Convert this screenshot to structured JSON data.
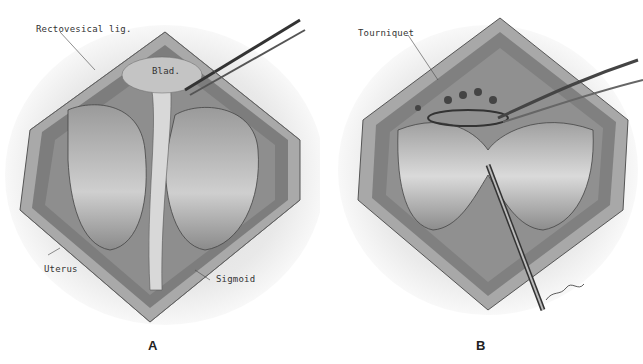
{
  "figure": {
    "panels": [
      {
        "id": "A",
        "caption": "A",
        "labels": {
          "rectovesical": "Rectovesical lig.",
          "bladder": "Blad.",
          "uterus": "Uterus",
          "sigmoid": "Sigmoid"
        }
      },
      {
        "id": "B",
        "caption": "B",
        "labels": {
          "tourniquet": "Tourniquet"
        },
        "signature": "signature"
      }
    ]
  }
}
